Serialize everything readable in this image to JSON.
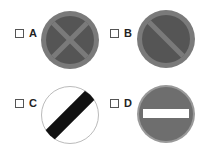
{
  "question": {
    "options": [
      {
        "letter": "A",
        "sign": "clearway-sign",
        "description": "circle with X cross"
      },
      {
        "letter": "B",
        "sign": "no-waiting-sign",
        "description": "circle with single diagonal"
      },
      {
        "letter": "C",
        "sign": "national-speed-limit-sign",
        "description": "white circle with black diagonal band"
      },
      {
        "letter": "D",
        "sign": "no-entry-sign",
        "description": "circle with horizontal white bar"
      }
    ]
  },
  "colors": {
    "sign_ring": "#7a7a7a",
    "sign_fill": "#555555",
    "sign_bar": "#ffffff",
    "diag_band": "#111111",
    "outline": "#bbbbbb"
  }
}
